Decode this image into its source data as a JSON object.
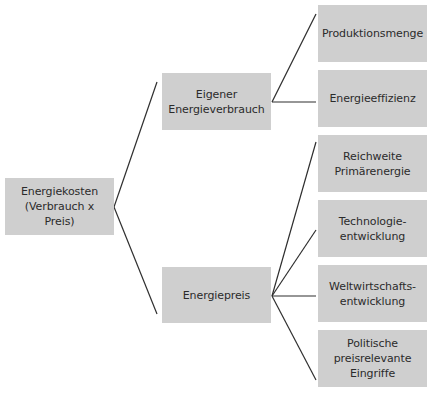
{
  "diagram": {
    "type": "tree",
    "colors": {
      "box_fill": "#cfcfcf",
      "line": "#2f2f2f",
      "text": "#2b2b2b",
      "background": "#ffffff"
    },
    "root": {
      "label": "Energiekosten\n(Verbrauch x Preis)"
    },
    "level1": [
      {
        "label": "Eigener\nEnergieverbrauch",
        "children": [
          {
            "label": "Produktionsmenge"
          },
          {
            "label": "Energieeffizienz"
          }
        ]
      },
      {
        "label": "Energiepreis",
        "children": [
          {
            "label": "Reichweite\nPrimärenergie"
          },
          {
            "label": "Technologie-\nentwicklung"
          },
          {
            "label": "Weltwirtschafts-\nentwicklung"
          },
          {
            "label": "Politische\npreisrelevante\nEingriffe"
          }
        ]
      }
    ]
  }
}
